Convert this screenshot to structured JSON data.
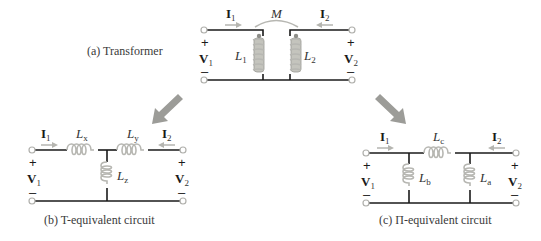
{
  "transformer": {
    "caption": "(a)  Transformer",
    "mutual_label": "M",
    "current_left": {
      "main": "I",
      "sub": "1"
    },
    "current_right": {
      "main": "I",
      "sub": "2"
    },
    "voltage_left": {
      "main": "V",
      "sub": "1"
    },
    "voltage_right": {
      "main": "V",
      "sub": "2"
    },
    "inductor_left": {
      "main": "L",
      "sub": "1"
    },
    "inductor_right": {
      "main": "L",
      "sub": "2"
    },
    "plus": "+",
    "minus": "–"
  },
  "t_circuit": {
    "caption": "(b)  T-equivalent circuit",
    "current_left": {
      "main": "I",
      "sub": "1"
    },
    "current_right": {
      "main": "I",
      "sub": "2"
    },
    "voltage_left": {
      "main": "V",
      "sub": "1"
    },
    "voltage_right": {
      "main": "V",
      "sub": "2"
    },
    "inductor_x": {
      "main": "L",
      "sub": "x"
    },
    "inductor_y": {
      "main": "L",
      "sub": "y"
    },
    "inductor_z": {
      "main": "L",
      "sub": "z"
    },
    "plus": "+",
    "minus": "–"
  },
  "pi_circuit": {
    "caption": "(c)  Π-equivalent circuit",
    "current_left": {
      "main": "I",
      "sub": "1"
    },
    "current_right": {
      "main": "I",
      "sub": "2"
    },
    "voltage_left": {
      "main": "V",
      "sub": "1"
    },
    "voltage_right": {
      "main": "V",
      "sub": "2"
    },
    "inductor_a": {
      "main": "L",
      "sub": "a"
    },
    "inductor_b": {
      "main": "L",
      "sub": "b"
    },
    "inductor_c": {
      "main": "L",
      "sub": "c"
    },
    "plus": "+",
    "minus": "–"
  },
  "colors": {
    "wire": "#1a1a1a",
    "coil": "#b7b7b2",
    "arrow": "#9c9c98",
    "terminal": "#b0b0ac"
  }
}
